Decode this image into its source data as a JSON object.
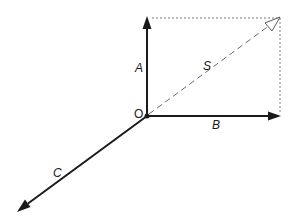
{
  "diagram": {
    "type": "vector-diagram",
    "origin": {
      "label": "O",
      "x": 147,
      "y": 116
    },
    "vectors": [
      {
        "id": "A",
        "label": "A",
        "from": [
          147,
          116
        ],
        "to": [
          147,
          17
        ],
        "style": "solid",
        "direction": "up"
      },
      {
        "id": "B",
        "label": "B",
        "from": [
          147,
          116
        ],
        "to": [
          280,
          116
        ],
        "style": "solid",
        "direction": "right"
      },
      {
        "id": "C",
        "label": "C",
        "from": [
          147,
          116
        ],
        "to": [
          18,
          211
        ],
        "style": "solid",
        "direction": "down-left"
      },
      {
        "id": "S",
        "label": "S",
        "from": [
          147,
          116
        ],
        "to": [
          280,
          18
        ],
        "style": "dashed",
        "direction": "up-right",
        "note": "resultant of A and B"
      }
    ],
    "guides": [
      {
        "id": "top-edge",
        "from": [
          147,
          18
        ],
        "to": [
          280,
          18
        ],
        "style": "dotted"
      },
      {
        "id": "right-edge",
        "from": [
          280,
          18
        ],
        "to": [
          280,
          116
        ],
        "style": "dotted"
      }
    ],
    "labels": {
      "origin": "O",
      "A": "A",
      "B": "B",
      "C": "C",
      "S": "S"
    },
    "colors": {
      "vector": "#1a1a1a",
      "resultant": "#6b6b6b",
      "guide": "#7a7a7a",
      "background": "#ffffff"
    }
  }
}
